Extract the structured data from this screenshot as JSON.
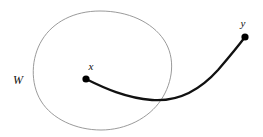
{
  "figure": {
    "type": "geometric-diagram",
    "background_color": "#ffffff",
    "width": 263,
    "height": 137,
    "labels": [
      {
        "id": "w",
        "text": "W",
        "x": 18,
        "y": 84,
        "style": "italic-serif",
        "color": "#111111",
        "font_size": 12
      },
      {
        "id": "x",
        "text": "x",
        "x": 91,
        "y": 70,
        "style": "italic-serif",
        "color": "#111111",
        "font_size": 11
      },
      {
        "id": "y",
        "text": "y",
        "x": 243,
        "y": 27,
        "style": "italic-serif",
        "color": "#111111",
        "font_size": 11
      }
    ],
    "points": [
      {
        "id": "x",
        "label": "x",
        "cx": 86,
        "cy": 79,
        "r": 3.6,
        "color": "#000000"
      },
      {
        "id": "y",
        "label": "y",
        "cx": 245,
        "cy": 37,
        "r": 3.6,
        "color": "#000000"
      }
    ],
    "region": {
      "id": "W",
      "label": "W",
      "stroke_color": "#8e8e8e",
      "stroke_width": 0.9,
      "fill": "none",
      "path": "M 100 11 C 128 11 152 22 164 40 C 176 58 173 82 161 100 C 149 118 126 130 101 130 C 76 130 52 119 41 101 C 30 83 31 58 42 40 C 53 22 74 11 100 11 Z"
    },
    "path_curve": {
      "id": "x-to-y",
      "from": "x",
      "to": "y",
      "stroke_color": "#111111",
      "stroke_width": 2.3,
      "path": "M 86 79 C 104 88 126 98 152 100 C 178 102 200 90 218 70 C 230 56 239 45 245 37"
    }
  }
}
